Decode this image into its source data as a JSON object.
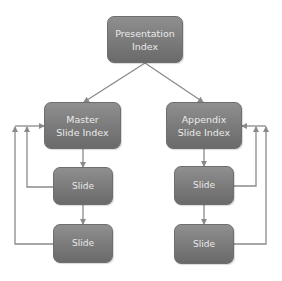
{
  "diagram": {
    "type": "flowchart",
    "colors": {
      "node_fill": "#7d7d7d",
      "node_text": "#eaeaea",
      "connector": "#8a8a8a",
      "background": "#ffffff"
    },
    "nodes": {
      "presentation": {
        "line1": "Presentation",
        "line2": "Index"
      },
      "master": {
        "line1": "Master",
        "line2": "Slide Index"
      },
      "appendix": {
        "line1": "Appendix",
        "line2": "Slide Index"
      },
      "master_slide_1": {
        "label": "Slide"
      },
      "master_slide_2": {
        "label": "Slide"
      },
      "appendix_slide_1": {
        "label": "Slide"
      },
      "appendix_slide_2": {
        "label": "Slide"
      }
    },
    "edges": [
      {
        "from": "Presentation Index",
        "to": "Master Slide Index"
      },
      {
        "from": "Presentation Index",
        "to": "Appendix Slide Index"
      },
      {
        "from": "Master Slide Index",
        "to": "Slide (master 1)"
      },
      {
        "from": "Slide (master 1)",
        "to": "Slide (master 2)"
      },
      {
        "from": "Slide (master 1)",
        "to": "Master Slide Index",
        "style": "feedback"
      },
      {
        "from": "Slide (master 2)",
        "to": "Master Slide Index",
        "style": "feedback"
      },
      {
        "from": "Appendix Slide Index",
        "to": "Slide (appendix 1)"
      },
      {
        "from": "Slide (appendix 1)",
        "to": "Slide (appendix 2)"
      },
      {
        "from": "Slide (appendix 1)",
        "to": "Appendix Slide Index",
        "style": "feedback"
      },
      {
        "from": "Slide (appendix 2)",
        "to": "Appendix Slide Index",
        "style": "feedback"
      }
    ]
  }
}
